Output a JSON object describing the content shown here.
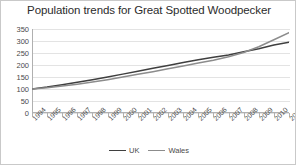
{
  "figure": {
    "border_color": "#c9c9c9",
    "background": "#ffffff"
  },
  "chart_data": {
    "type": "line",
    "title": "Population trends for Great Spotted Woodpecker",
    "xlabel": "",
    "ylabel": "",
    "ylim": [
      0,
      350
    ],
    "yticks": [
      0,
      50,
      100,
      150,
      200,
      250,
      300,
      350
    ],
    "grid": "horizontal",
    "legend_position": "bottom",
    "categories": [
      "1994",
      "1995",
      "1996",
      "1997",
      "1998",
      "1999",
      "2000",
      "2001",
      "2002",
      "2003",
      "2004",
      "2005",
      "2006",
      "2007",
      "2008",
      "2009",
      "2010",
      "2011"
    ],
    "series": [
      {
        "name": "UK",
        "color": "#3f3f3f",
        "values": [
          100,
          108,
          118,
          128,
          139,
          150,
          162,
          174,
          186,
          198,
          210,
          222,
          232,
          242,
          255,
          268,
          283,
          295
        ]
      },
      {
        "name": "Wales",
        "color": "#8c8c8c",
        "values": [
          100,
          105,
          112,
          120,
          129,
          139,
          150,
          161,
          172,
          184,
          196,
          208,
          220,
          234,
          252,
          276,
          305,
          335
        ]
      }
    ]
  }
}
